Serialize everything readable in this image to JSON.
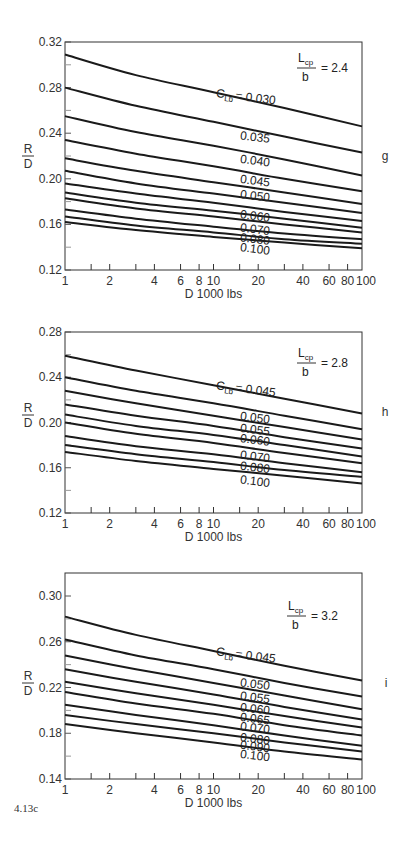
{
  "figure_id": "4.13c",
  "chart_data": [
    {
      "type": "line",
      "panel": "g",
      "param_label": "Lcp/b = 2.4",
      "param_value": 2.4,
      "xlabel": "D 1000 lbs",
      "ylabel": "R/D",
      "xscale": "log",
      "xlim": [
        1,
        100
      ],
      "ylim": [
        0.12,
        0.32
      ],
      "yticks": [
        0.12,
        0.16,
        0.2,
        0.24,
        0.28,
        0.32
      ],
      "ytick_labels": [
        "0.12",
        "0.16",
        "0.20",
        "0.24",
        "0.28",
        "0.32"
      ],
      "xtick_labels": [
        "1",
        "2",
        "4",
        "6",
        "8",
        "10",
        "20",
        "40",
        "60",
        "80",
        "100"
      ],
      "legend_prefix": "C_Lb =",
      "x": [
        1,
        3,
        10,
        30,
        100
      ],
      "series": [
        {
          "name": "0.030",
          "labeled": true,
          "values": [
            0.309,
            0.291,
            0.276,
            0.262,
            0.246
          ]
        },
        {
          "name": "0.035",
          "labeled": true,
          "values": [
            0.28,
            0.264,
            0.25,
            0.237,
            0.223
          ]
        },
        {
          "name": "0.040",
          "labeled": true,
          "values": [
            0.255,
            0.241,
            0.229,
            0.217,
            0.203
          ]
        },
        {
          "name": "0.045",
          "labeled": true,
          "values": [
            0.234,
            0.222,
            0.211,
            0.2,
            0.189
          ]
        },
        {
          "name": "0.050",
          "labeled": true,
          "values": [
            0.218,
            0.207,
            0.197,
            0.188,
            0.178
          ]
        },
        {
          "name": "0.055",
          "labeled": false,
          "values": [
            0.207,
            0.196,
            0.187,
            0.179,
            0.17
          ]
        },
        {
          "name": "0.060",
          "labeled": true,
          "values": [
            0.196,
            0.187,
            0.179,
            0.171,
            0.163
          ]
        },
        {
          "name": "0.065",
          "labeled": false,
          "values": [
            0.188,
            0.179,
            0.172,
            0.165,
            0.157
          ]
        },
        {
          "name": "0.070",
          "labeled": true,
          "values": [
            0.183,
            0.174,
            0.167,
            0.16,
            0.153
          ]
        },
        {
          "name": "0.080",
          "labeled": true,
          "values": [
            0.173,
            0.165,
            0.158,
            0.152,
            0.147
          ]
        },
        {
          "name": "0.090",
          "labeled": false,
          "values": [
            0.167,
            0.159,
            0.153,
            0.147,
            0.143
          ]
        },
        {
          "name": "0.100",
          "labeled": true,
          "values": [
            0.162,
            0.155,
            0.149,
            0.144,
            0.139
          ]
        }
      ]
    },
    {
      "type": "line",
      "panel": "h",
      "param_label": "Lcp/b = 2.8",
      "param_value": 2.8,
      "xlabel": "D 1000 lbs",
      "ylabel": "R/D",
      "xscale": "log",
      "xlim": [
        1,
        100
      ],
      "ylim": [
        0.12,
        0.28
      ],
      "yticks": [
        0.12,
        0.16,
        0.2,
        0.24,
        0.28
      ],
      "ytick_labels": [
        "0.12",
        "0.16",
        "0.20",
        "0.24",
        "0.28"
      ],
      "xtick_labels": [
        "1",
        "2",
        "4",
        "6",
        "8",
        "10",
        "20",
        "40",
        "60",
        "80",
        "100"
      ],
      "legend_prefix": "C_Lb =",
      "x": [
        1,
        3,
        10,
        30,
        100
      ],
      "series": [
        {
          "name": "0.045",
          "labeled": true,
          "values": [
            0.259,
            0.246,
            0.233,
            0.221,
            0.208
          ]
        },
        {
          "name": "0.050",
          "labeled": true,
          "values": [
            0.24,
            0.228,
            0.217,
            0.206,
            0.194
          ]
        },
        {
          "name": "0.055",
          "labeled": true,
          "values": [
            0.228,
            0.217,
            0.206,
            0.196,
            0.185
          ]
        },
        {
          "name": "0.060",
          "labeled": true,
          "values": [
            0.216,
            0.206,
            0.197,
            0.187,
            0.177
          ]
        },
        {
          "name": "0.065",
          "labeled": false,
          "values": [
            0.207,
            0.197,
            0.189,
            0.18,
            0.17
          ]
        },
        {
          "name": "0.070",
          "labeled": true,
          "values": [
            0.2,
            0.19,
            0.182,
            0.173,
            0.164
          ]
        },
        {
          "name": "0.080",
          "labeled": true,
          "values": [
            0.188,
            0.179,
            0.172,
            0.164,
            0.156
          ]
        },
        {
          "name": "0.090",
          "labeled": false,
          "values": [
            0.18,
            0.172,
            0.165,
            0.158,
            0.152
          ]
        },
        {
          "name": "0.100",
          "labeled": true,
          "values": [
            0.174,
            0.166,
            0.159,
            0.153,
            0.146
          ]
        }
      ]
    },
    {
      "type": "line",
      "panel": "i",
      "param_label": "Lcp/b = 3.2",
      "param_value": 3.2,
      "xlabel": "D 1000 lbs",
      "ylabel": "R/D",
      "xscale": "log",
      "xlim": [
        1,
        100
      ],
      "ylim": [
        0.14,
        0.32
      ],
      "yticks": [
        0.14,
        0.18,
        0.22,
        0.26,
        0.3
      ],
      "ytick_labels": [
        "0.14",
        "0.18",
        "0.22",
        "0.26",
        "0.30"
      ],
      "xtick_labels": [
        "1",
        "2",
        "4",
        "6",
        "8",
        "10",
        "20",
        "40",
        "60",
        "80",
        "100"
      ],
      "legend_prefix": "C_Lb =",
      "x": [
        1,
        3,
        10,
        30,
        100
      ],
      "series": [
        {
          "name": "0.045",
          "labeled": true,
          "values": [
            0.282,
            0.266,
            0.252,
            0.239,
            0.226
          ]
        },
        {
          "name": "0.050",
          "labeled": true,
          "values": [
            0.262,
            0.248,
            0.236,
            0.224,
            0.212
          ]
        },
        {
          "name": "0.055",
          "labeled": true,
          "values": [
            0.248,
            0.236,
            0.224,
            0.213,
            0.201
          ]
        },
        {
          "name": "0.060",
          "labeled": true,
          "values": [
            0.236,
            0.225,
            0.214,
            0.203,
            0.192
          ]
        },
        {
          "name": "0.065",
          "labeled": true,
          "values": [
            0.225,
            0.215,
            0.205,
            0.195,
            0.185
          ]
        },
        {
          "name": "0.070",
          "labeled": true,
          "values": [
            0.216,
            0.206,
            0.197,
            0.187,
            0.178
          ]
        },
        {
          "name": "0.080",
          "labeled": true,
          "values": [
            0.205,
            0.196,
            0.187,
            0.178,
            0.169
          ]
        },
        {
          "name": "0.090",
          "labeled": true,
          "values": [
            0.196,
            0.188,
            0.18,
            0.172,
            0.164
          ]
        },
        {
          "name": "0.100",
          "labeled": true,
          "values": [
            0.188,
            0.18,
            0.172,
            0.164,
            0.157
          ]
        }
      ]
    }
  ],
  "panels": [
    {
      "letter": "g",
      "param_num": "L",
      "param_sub": "cp",
      "param_den": "b",
      "param_eq": "= 2.4",
      "curve_prefix_c": "C",
      "curve_prefix_sub": "Lb",
      "curve_prefix_eq": "= 0.030"
    },
    {
      "letter": "h",
      "param_num": "L",
      "param_sub": "cp",
      "param_den": "b",
      "param_eq": "= 2.8",
      "curve_prefix_c": "C",
      "curve_prefix_sub": "Lb",
      "curve_prefix_eq": "= 0.045"
    },
    {
      "letter": "i",
      "param_num": "L",
      "param_sub": "cp",
      "param_den": "b",
      "param_eq": "= 3.2",
      "curve_prefix_c": "C",
      "curve_prefix_sub": "Lb",
      "curve_prefix_eq": "= 0.045"
    }
  ],
  "axis": {
    "ylabel_num": "R",
    "ylabel_den": "D",
    "xlabel": "D 1000 lbs"
  }
}
